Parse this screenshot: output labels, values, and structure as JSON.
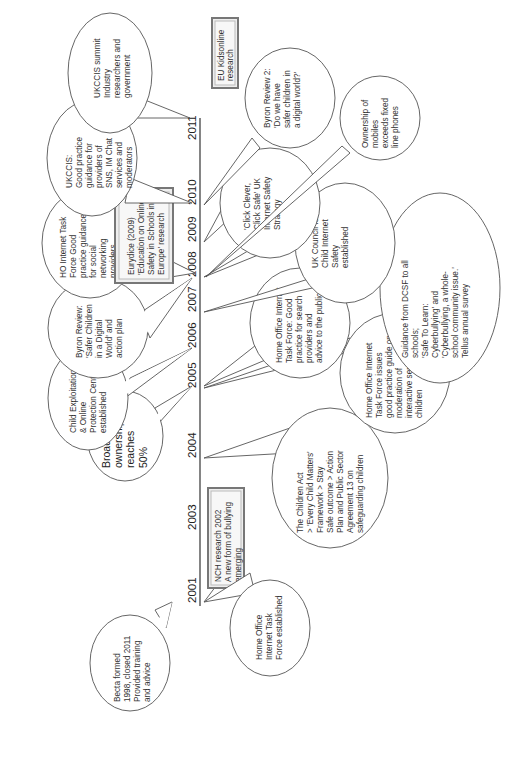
{
  "diagram": {
    "title": "",
    "orientation": "rotated-90-ccw",
    "axis": {
      "years": [
        "2001",
        "2003",
        "2004",
        "2005",
        "2006",
        "2007",
        "2008",
        "2009",
        "2010",
        "2011"
      ]
    },
    "events": [
      {
        "id": "becta",
        "year": "2001",
        "side": "above",
        "shape": "bubble",
        "lines": [
          "Becta formed",
          "1998, closed 2011",
          "Provided training",
          "and advice"
        ]
      },
      {
        "id": "ho-taskforce",
        "year": "2001",
        "side": "below",
        "shape": "bubble",
        "lines": [
          "Home Office",
          "Internet Task",
          "Force established"
        ]
      },
      {
        "id": "nch",
        "year": "2002",
        "side": "below",
        "shape": "box",
        "lines": [
          "NCH research  2002",
          "A new form of bullying",
          "emerging"
        ]
      },
      {
        "id": "children-act",
        "year": "2004",
        "side": "below",
        "shape": "bubble",
        "lines": [
          "The Children Act",
          "> 'Every Child Matters'",
          "Framework > Stay",
          "Safe outcome > Action",
          "Plan and Public Sector",
          "Agreement 13 on",
          "safeguarding children"
        ]
      },
      {
        "id": "broadband",
        "year": "2005",
        "side": "above",
        "shape": "bubble",
        "lines": [
          "Broadband",
          "ownership",
          "reaches",
          "50%"
        ]
      },
      {
        "id": "ho-moderation",
        "year": "2005",
        "side": "below",
        "shape": "bubble",
        "lines": [
          "Home Office Internet",
          "Task Force issues",
          "good practice guide on",
          "moderation of",
          "interactive services for",
          "children"
        ]
      },
      {
        "id": "ceop",
        "year": "2006",
        "side": "above",
        "shape": "bubble",
        "lines": [
          "Child Exploitation",
          "& Online",
          "Protection Centre",
          "established"
        ]
      },
      {
        "id": "ho-search",
        "year": "2005",
        "side": "below",
        "shape": "bubble",
        "lines": [
          "Home Office Internet",
          "Task Force: Good",
          "practice for search",
          "providers and",
          "advice to the public"
        ]
      },
      {
        "id": "byron",
        "year": "2008",
        "side": "above",
        "shape": "bubble",
        "lines": [
          "Byron Review:",
          "'Safer Children",
          "in a Digital",
          "World' and",
          "action plan"
        ]
      },
      {
        "id": "dcsf",
        "year": "2007",
        "side": "below",
        "shape": "bubble",
        "lines": [
          "Guidance from DCSF to all",
          "schools;",
          "'Safe To Learn:",
          "Cyberbullying' and",
          "'Cyberbullying, a whole-",
          "school community issue.'",
          "Tellus annual survey"
        ]
      },
      {
        "id": "ho-sns",
        "year": "2008",
        "side": "above",
        "shape": "bubble",
        "lines": [
          "HO Internet Task",
          "Force Good",
          "practice guidance",
          "for social",
          "networking",
          "providers"
        ]
      },
      {
        "id": "ukccis-est",
        "year": "2008",
        "side": "below",
        "shape": "bubble",
        "lines": [
          "UK Council for",
          "Child Internet",
          "Safety",
          "established"
        ]
      },
      {
        "id": "eurydice",
        "year": "2009",
        "side": "above",
        "shape": "box",
        "lines": [
          "Eurydice (2009)",
          "'Education on Online",
          "Safety in Schools in",
          "Europe' research"
        ]
      },
      {
        "id": "click-clever",
        "year": "2009",
        "side": "below",
        "shape": "bubble",
        "lines": [
          "'Click Clever,",
          "Click Safe'  UK",
          "Internet Safety",
          "Strategy"
        ]
      },
      {
        "id": "mobiles",
        "year": "2008",
        "side": "below",
        "shape": "bubble",
        "lines": [
          "Ownership of",
          "mobiles",
          "exceeds fixed",
          "line phones"
        ]
      },
      {
        "id": "ukccis-guidance",
        "year": "2010",
        "side": "above",
        "shape": "bubble",
        "lines": [
          "UKCCIS:",
          "Good practice",
          "guidance for",
          "providers of",
          "SNS, IM Chat",
          "services and",
          "moderators"
        ]
      },
      {
        "id": "byron2",
        "year": "2010",
        "side": "below",
        "shape": "bubble",
        "lines": [
          "Byron Review 2:",
          "'Do we have",
          "safer children in",
          "a digital world?'"
        ]
      },
      {
        "id": "ukccis-summit",
        "year": "2011",
        "side": "above",
        "shape": "bubble",
        "lines": [
          "UKCCIS summit",
          "Industry",
          "researchers and",
          "government"
        ]
      },
      {
        "id": "eu-kids",
        "year": "2011",
        "side": "below",
        "shape": "box",
        "lines": [
          "EU Kidsonline",
          "research"
        ]
      }
    ]
  }
}
